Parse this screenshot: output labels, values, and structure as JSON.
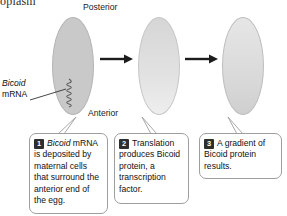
{
  "figure": {
    "cut_off_heading": "oplasm",
    "orientation_labels": {
      "posterior": "Posterior",
      "anterior": "Anterior"
    },
    "mrna_label": {
      "gene": "Bicoid",
      "molecule": "mRNA"
    },
    "icons": {
      "squiggle": "mrna-squiggle-icon",
      "arrow": "right-arrow-icon",
      "leader_line": "leader-line-icon",
      "pointer": "callout-pointer-icon"
    },
    "colors": {
      "egg_uniform_gray": "#c9c9c9",
      "egg_light": "#e6e6e6",
      "egg_gradient_dark": "#cfcfcf",
      "outline": "#9e9e9e",
      "badge": "#2e2e2e",
      "text": "#111111",
      "background": "#ffffff"
    },
    "stages": [
      {
        "number": "1",
        "egg_name": "egg-stage-1",
        "fill_description": "uniform-gray",
        "text_prefix_italic": "Bicoid",
        "text": " mRNA is deposited by maternal cells that surround the anterior end of the egg."
      },
      {
        "number": "2",
        "egg_name": "egg-stage-2",
        "fill_description": "light-gradient",
        "text_prefix_italic": "",
        "text": "Translation produces Bicoid protein, a transcription factor."
      },
      {
        "number": "3",
        "egg_name": "egg-stage-3",
        "fill_description": "anterior-to-posterior-gradient",
        "text_prefix_italic": "",
        "text": "A gradient of Bicoid protein results."
      }
    ]
  }
}
